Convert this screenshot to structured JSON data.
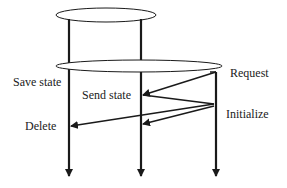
{
  "diagram": {
    "type": "protocol-sequence",
    "colors": {
      "line": "#1a1a1a",
      "background": "#ffffff"
    },
    "lifelines": [
      {
        "id": "left",
        "x": 69
      },
      {
        "id": "middle",
        "x": 141
      },
      {
        "id": "right",
        "x": 216
      }
    ],
    "groups": [
      {
        "id": "top-ellipse",
        "shape": "ellipse",
        "spans": [
          "left",
          "middle"
        ]
      },
      {
        "id": "wide-ellipse",
        "shape": "ellipse",
        "spans": [
          "left",
          "middle",
          "right"
        ]
      }
    ],
    "labels": {
      "save_state": "Save state",
      "send_state": "Send state",
      "request": "Request",
      "initialize": "Initialize",
      "delete": "Delete"
    },
    "messages": [
      {
        "from": "right",
        "to": "middle",
        "label": "Send state"
      },
      {
        "from": "middle",
        "to": "right",
        "label": "Initialize"
      },
      {
        "from": "right",
        "to": "left",
        "label": "Delete"
      },
      {
        "from": "right",
        "to": "middle",
        "label": ""
      }
    ]
  }
}
